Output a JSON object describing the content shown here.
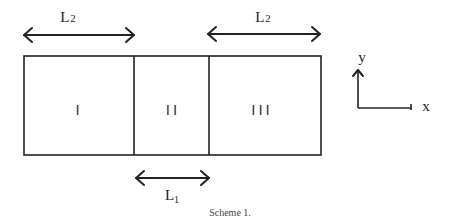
{
  "diagram": {
    "regions": [
      {
        "id": "region-1",
        "label": "I"
      },
      {
        "id": "region-2",
        "label": "II"
      },
      {
        "id": "region-3",
        "label": "III"
      }
    ],
    "dimensions": {
      "left_span": {
        "main": "L",
        "sub": "2"
      },
      "right_span": {
        "main": "L",
        "sub": "2"
      },
      "middle_span": {
        "main": "L",
        "sub": "1"
      }
    },
    "axes": {
      "x_label": "x",
      "y_label": "y"
    },
    "caption": "Scheme 1."
  }
}
